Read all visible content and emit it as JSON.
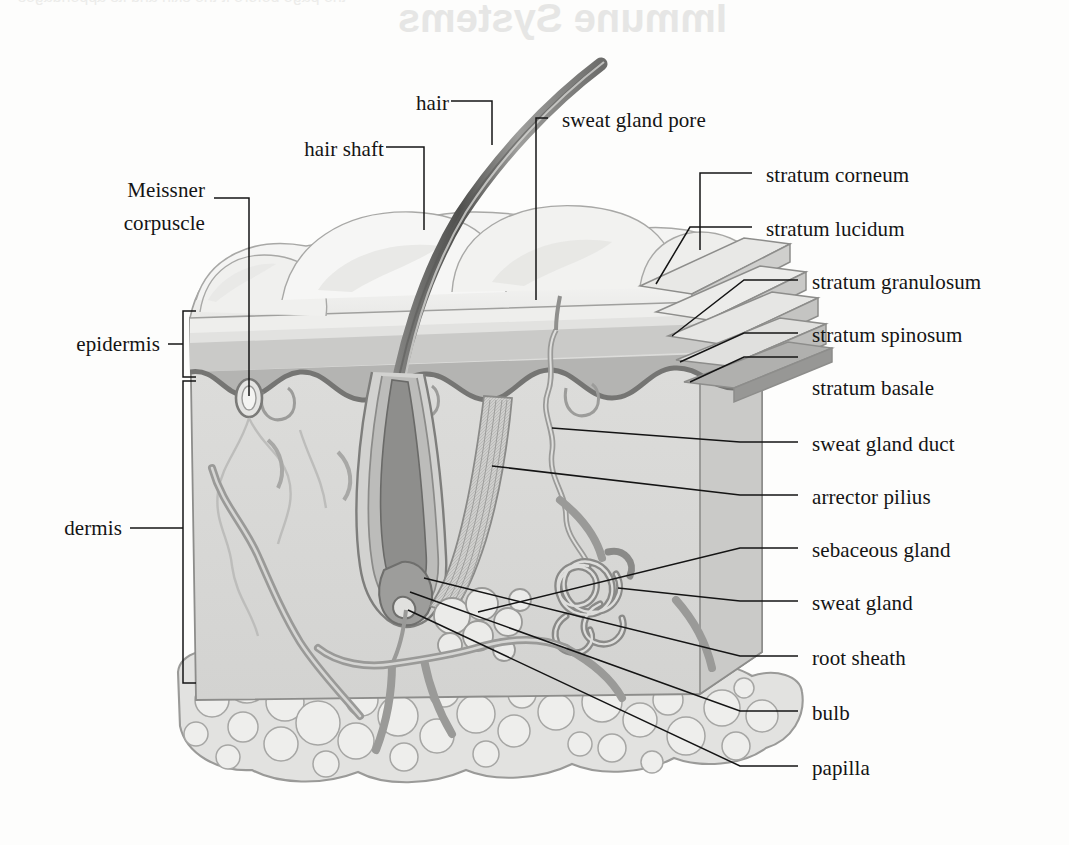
{
  "figure": {
    "background_color": "#fdfdfc",
    "line_color": "#141414",
    "label_font_size_px": 21
  },
  "artifacts": {
    "show_show_through": true,
    "reversed_title": "Immune Systems",
    "reversed_header_line": "the page before it the skin and its appendages",
    "reversed_body": "in the dermis lie the blood vessels and\nnerve endings which supply the skin\nwith nutrients and with sensation"
  },
  "labels_left": [
    {
      "id": "meissner-corpuscle",
      "line1": "Meissner",
      "line2": "corpuscle",
      "x": 205,
      "y": 190
    },
    {
      "id": "epidermis",
      "text": "epidermis",
      "x": 160,
      "y": 340
    },
    {
      "id": "dermis",
      "text": "dermis",
      "x": 120,
      "y": 525
    }
  ],
  "labels_top": [
    {
      "id": "hair",
      "text": "hair",
      "x": 437,
      "y": 100
    },
    {
      "id": "hair-shaft",
      "text": "hair shaft",
      "x": 372,
      "y": 146
    },
    {
      "id": "sweat-gland-pore",
      "text": "sweat gland pore",
      "x": 562,
      "y": 117
    }
  ],
  "labels_right": [
    {
      "id": "stratum-corneum",
      "text": "stratum corneum",
      "x": 766,
      "y": 172
    },
    {
      "id": "stratum-lucidum",
      "text": "stratum lucidum",
      "x": 766,
      "y": 226
    },
    {
      "id": "stratum-granulosum",
      "text": "stratum granulosum",
      "x": 812,
      "y": 279
    },
    {
      "id": "stratum-spinosum",
      "text": "stratum spinosum",
      "x": 812,
      "y": 332
    },
    {
      "id": "stratum-basale",
      "text": "stratum basale",
      "x": 812,
      "y": 356
    },
    {
      "id": "sweat-gland-duct",
      "text": "sweat gland duct",
      "x": 812,
      "y": 441
    },
    {
      "id": "arrector-pilius",
      "text": "arrector pilius",
      "x": 812,
      "y": 494
    },
    {
      "id": "sebaceous-gland",
      "text": "sebaceous gland",
      "x": 812,
      "y": 547
    },
    {
      "id": "sweat-gland",
      "text": "sweat gland",
      "x": 812,
      "y": 600
    },
    {
      "id": "root-sheath",
      "text": "root sheath",
      "x": 812,
      "y": 655
    },
    {
      "id": "bulb",
      "text": "bulb",
      "x": 812,
      "y": 710
    },
    {
      "id": "papilla",
      "text": "papilla",
      "x": 812,
      "y": 765
    }
  ],
  "brackets": {
    "epidermis": {
      "label": "epidermis",
      "top_y": 311,
      "bottom_y": 377,
      "x": 183
    },
    "dermis": {
      "label": "dermis",
      "top_y": 381,
      "bottom_y": 683,
      "x": 183
    }
  },
  "palette": {
    "ink": "#141414",
    "outline_mid": "#8d8d8d",
    "outline_dark": "#5d5d5d",
    "surface_pale": "#f2f2f1",
    "epidermis_upper": "#e4e4e2",
    "epidermis_band": "#c4c4c2",
    "basale_band": "#9c9c9a",
    "dermis_fill": "#dcdcda",
    "hair_dark": "#6a6a6a",
    "hair_light": "#b6b6b4",
    "vessel": "#9a9a98",
    "fat_fill": "#e0e0de",
    "follicle_dark": "#8a8a88"
  },
  "structures": [
    "hair shaft",
    "skin surface ridges",
    "stepped epidermal strata wedge",
    "dermal papillae wave",
    "Meissner corpuscle",
    "sweat gland duct",
    "coiled sweat gland",
    "sebaceous gland",
    "arrector pili muscle",
    "hair follicle root sheath",
    "hair bulb",
    "dermal papilla",
    "blood vessels",
    "subcutaneous adipose tissue"
  ]
}
